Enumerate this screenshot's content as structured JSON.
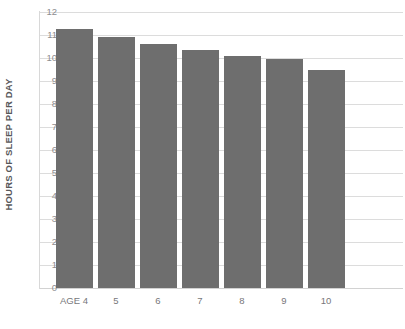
{
  "chart_data": {
    "type": "bar",
    "title": "",
    "subtitle": "",
    "xlabel": "",
    "ylabel": "HOURS OF SLEEP PER DAY",
    "categories": [
      "AGE 4",
      "5",
      "6",
      "7",
      "8",
      "9",
      "10"
    ],
    "values": [
      11.25,
      10.9,
      10.6,
      10.35,
      10.1,
      9.95,
      9.5
    ],
    "series": [
      {
        "name": "Hours of sleep per day",
        "values": [
          11.25,
          10.9,
          10.6,
          10.35,
          10.1,
          9.95,
          9.5
        ]
      }
    ],
    "ylim": [
      0,
      12
    ],
    "ytick_labels": [
      "0",
      "1",
      "2",
      "3",
      "4",
      "5",
      "6",
      "7",
      "8",
      "9",
      "10",
      "11",
      "12"
    ],
    "ytick_values": [
      0,
      1,
      2,
      3,
      4,
      5,
      6,
      7,
      8,
      9,
      10,
      11,
      12
    ],
    "grid": true,
    "grid_axis": "y",
    "legend": false,
    "legend_position": "none",
    "annotations": [],
    "colors": {
      "bar": "#6e6e6e",
      "gridline": "#dcdcdc",
      "axis_line": "#d8d8d8",
      "tick_label": "#8d8d8f",
      "axis_title": "#58585a",
      "background": "#ffffff"
    }
  }
}
